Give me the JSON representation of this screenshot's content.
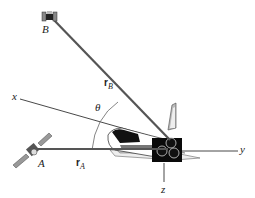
{
  "diagram": {
    "labels": {
      "point_a": "A",
      "point_b": "B",
      "axis_x": "x",
      "axis_y": "y",
      "axis_z": "z",
      "angle": "θ",
      "vector_a_main": "r",
      "vector_a_sub": "A",
      "vector_b_main": "r",
      "vector_b_sub": "B"
    },
    "colors": {
      "vector_line": "#555555",
      "axis_line": "#333333",
      "shuttle_body": "#111111",
      "shuttle_light": "#dddddd"
    }
  }
}
